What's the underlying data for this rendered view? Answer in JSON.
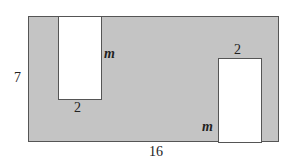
{
  "diagram": {
    "outer_rectangle": {
      "width_label": "16",
      "height_label": "7",
      "fill_color": "#c4c4c4",
      "border_color": "#555555"
    },
    "cutouts": [
      {
        "position": "top-left",
        "width_label": "2",
        "height_label": "m",
        "fill_color": "#ffffff"
      },
      {
        "position": "bottom-right",
        "width_label": "2",
        "height_label": "m",
        "fill_color": "#ffffff"
      }
    ]
  }
}
